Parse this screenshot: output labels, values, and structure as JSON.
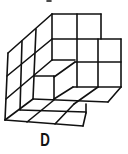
{
  "figure": {
    "type": "isometric-cube-arrangement",
    "line_color": "#111111",
    "background": "#ffffff"
  },
  "option": {
    "label": "D"
  }
}
